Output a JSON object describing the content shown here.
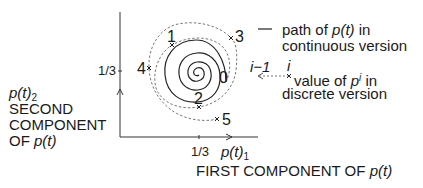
{
  "diagram": {
    "y_axis": {
      "symbol": "p(t)",
      "subscript": "2",
      "label_lines": [
        "SECOND",
        "COMPONENT",
        "OF "
      ],
      "label_tail": "p(t)",
      "tick": "1/3"
    },
    "x_axis": {
      "symbol": "p(t)",
      "subscript": "1",
      "label": "FIRST COMPONENT OF ",
      "label_tail": "p(t)",
      "tick": "1/3"
    },
    "points": [
      {
        "label": "0"
      },
      {
        "label": "1"
      },
      {
        "label": "2"
      },
      {
        "label": "3"
      },
      {
        "label": "4"
      },
      {
        "label": "5"
      }
    ],
    "legend": {
      "continuous": {
        "line1_pre": "path of ",
        "line1_it": "p(t)",
        "line1_post": " in",
        "line2": "continuous version"
      },
      "discrete": {
        "from_label": "i−1",
        "to_label": "i",
        "line1_pre": "value of ",
        "line1_sym": "p",
        "line1_sup": "i",
        "line1_post": " in",
        "line2": "discrete version"
      }
    },
    "colors": {
      "ink": "#1a1a1a",
      "dashed": "#777777"
    }
  }
}
